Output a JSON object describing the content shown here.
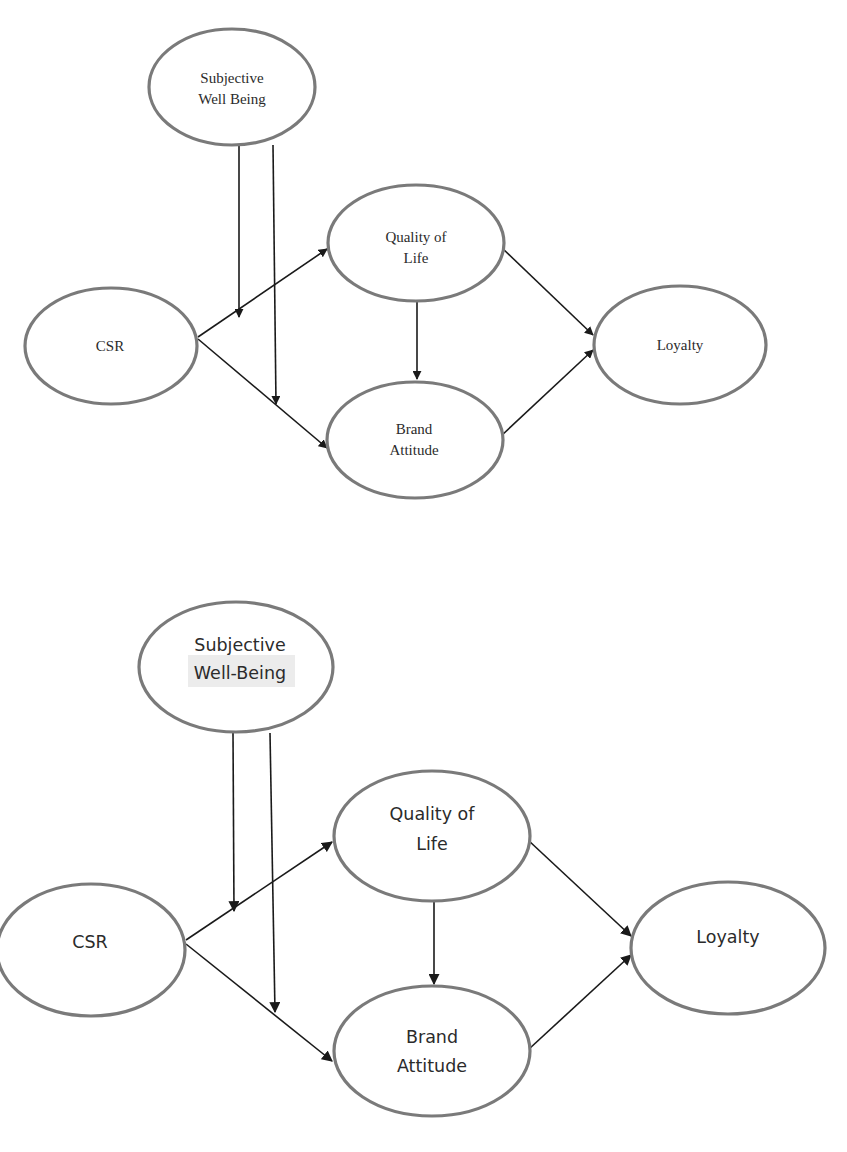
{
  "diagrams": [
    {
      "style": "serif",
      "nodes": {
        "swb": {
          "line1": "Subjective",
          "line2": "Well Being"
        },
        "csr": {
          "line1": "CSR"
        },
        "qol": {
          "line1": "Quality of",
          "line2": "Life"
        },
        "ba": {
          "line1": "Brand",
          "line2": "Attitude"
        },
        "loyalty": {
          "line1": "Loyalty"
        }
      },
      "edges": [
        {
          "from": "CSR",
          "to": "Quality of Life"
        },
        {
          "from": "CSR",
          "to": "Brand Attitude"
        },
        {
          "from": "Quality of Life",
          "to": "Brand Attitude"
        },
        {
          "from": "Quality of Life",
          "to": "Loyalty"
        },
        {
          "from": "Brand Attitude",
          "to": "Loyalty"
        },
        {
          "from": "Subjective Well Being",
          "to": "CSR→Quality of Life (moderation)"
        },
        {
          "from": "Subjective Well Being",
          "to": "CSR→Brand Attitude (moderation)"
        }
      ]
    },
    {
      "style": "sans",
      "nodes": {
        "swb": {
          "line1": "Subjective",
          "line2": "Well-Being"
        },
        "csr": {
          "line1": "CSR"
        },
        "qol": {
          "line1": "Quality of",
          "line2": "Life"
        },
        "ba": {
          "line1": "Brand",
          "line2": "Attitude"
        },
        "loyalty": {
          "line1": "Loyalty"
        }
      },
      "edges": [
        {
          "from": "CSR",
          "to": "Quality of Life"
        },
        {
          "from": "CSR",
          "to": "Brand Attitude"
        },
        {
          "from": "Quality of Life",
          "to": "Brand Attitude"
        },
        {
          "from": "Quality of Life",
          "to": "Loyalty"
        },
        {
          "from": "Brand Attitude",
          "to": "Loyalty"
        },
        {
          "from": "Subjective Well-Being",
          "to": "CSR→Quality of Life (moderation)"
        },
        {
          "from": "Subjective Well-Being",
          "to": "CSR→Brand Attitude (moderation)"
        }
      ]
    }
  ]
}
